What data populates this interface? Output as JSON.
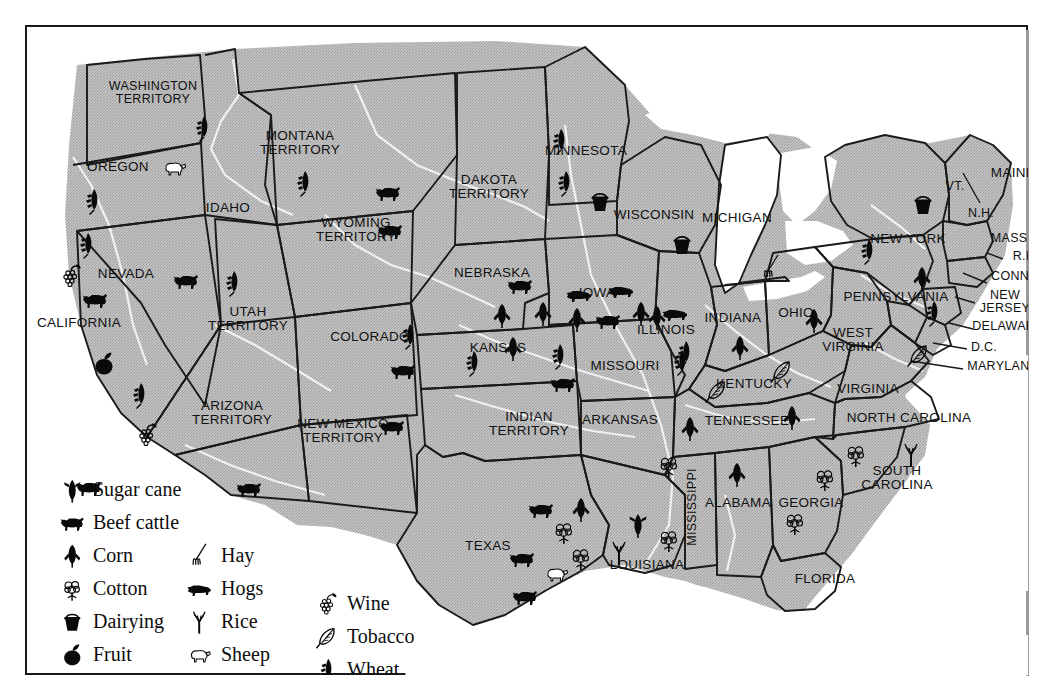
{
  "map": {
    "background_color": "#b9b9b9",
    "water_color": "#ffffff",
    "border_color": "#1a1a1a",
    "river_color": "#f2f2f2"
  },
  "legend": {
    "columns": [
      {
        "items": [
          {
            "label": "Sugar cane",
            "icon": "sugar-cane-icon"
          },
          {
            "label": "Beef cattle",
            "icon": "beef-cattle-icon"
          },
          {
            "label": "Corn",
            "icon": "corn-icon"
          },
          {
            "label": "Cotton",
            "icon": "cotton-icon"
          },
          {
            "label": "Dairying",
            "icon": "dairying-icon"
          },
          {
            "label": "Fruit",
            "icon": "fruit-icon"
          }
        ]
      },
      {
        "items": [
          {
            "label": "Hay",
            "icon": "hay-icon"
          },
          {
            "label": "Hogs",
            "icon": "hogs-icon"
          },
          {
            "label": "Rice",
            "icon": "rice-icon"
          },
          {
            "label": "Sheep",
            "icon": "sheep-icon"
          }
        ]
      },
      {
        "items": [
          {
            "label": "Wine",
            "icon": "wine-icon"
          },
          {
            "label": "Tobacco",
            "icon": "tobacco-icon"
          },
          {
            "label": "Wheat",
            "icon": "wheat-icon"
          }
        ]
      }
    ]
  },
  "states": [
    {
      "name": "WASHINGTON\nTERRITORY",
      "x": 128,
      "y": 68,
      "size": "s12"
    },
    {
      "name": "OREGON",
      "x": 93,
      "y": 142,
      "size": "s13"
    },
    {
      "name": "IDAHO",
      "x": 203,
      "y": 183,
      "size": "s13"
    },
    {
      "name": "MONTANA\nTERRITORY",
      "x": 275,
      "y": 118,
      "size": "s13"
    },
    {
      "name": "WYOMING\nTERRITORY",
      "x": 331,
      "y": 205,
      "size": "s13"
    },
    {
      "name": "NEVADA",
      "x": 101,
      "y": 249,
      "size": "s13"
    },
    {
      "name": "CALIFORNIA",
      "x": 54,
      "y": 298,
      "size": "s13"
    },
    {
      "name": "UTAH\nTERRITORY",
      "x": 223,
      "y": 294,
      "size": "s13"
    },
    {
      "name": "ARIZONA\nTERRITORY",
      "x": 207,
      "y": 388,
      "size": "s13"
    },
    {
      "name": "NEW MEXICO\nTERRITORY",
      "x": 318,
      "y": 406,
      "size": "s13"
    },
    {
      "name": "COLORADO",
      "x": 345,
      "y": 312,
      "size": "s13"
    },
    {
      "name": "DAKOTA\nTERRITORY",
      "x": 464,
      "y": 162,
      "size": "s13"
    },
    {
      "name": "NEBRASKA",
      "x": 467,
      "y": 248,
      "size": "s13"
    },
    {
      "name": "KANSAS",
      "x": 473,
      "y": 323,
      "size": "s13"
    },
    {
      "name": "INDIAN\nTERRITORY",
      "x": 504,
      "y": 399,
      "size": "s13"
    },
    {
      "name": "TEXAS",
      "x": 463,
      "y": 521,
      "size": "s13"
    },
    {
      "name": "MINNESOTA",
      "x": 561,
      "y": 126,
      "size": "s13"
    },
    {
      "name": "IOWA",
      "x": 572,
      "y": 268,
      "size": "s13"
    },
    {
      "name": "MISSOURI",
      "x": 600,
      "y": 341,
      "size": "s13"
    },
    {
      "name": "ARKANSAS",
      "x": 595,
      "y": 395,
      "size": "s13"
    },
    {
      "name": "LOUISIANA",
      "x": 622,
      "y": 540,
      "size": "s13"
    },
    {
      "name": "WISCONSIN",
      "x": 629,
      "y": 190,
      "size": "s13"
    },
    {
      "name": "ILLINOIS",
      "x": 641,
      "y": 305,
      "size": "s13"
    },
    {
      "name": "MICHIGAN",
      "x": 712,
      "y": 193,
      "size": "s13"
    },
    {
      "name": "INDIANA",
      "x": 708,
      "y": 293,
      "size": "s13"
    },
    {
      "name": "KENTUCKY",
      "x": 729,
      "y": 359,
      "size": "s13"
    },
    {
      "name": "TENNESSEE",
      "x": 722,
      "y": 396,
      "size": "s13"
    },
    {
      "name": "MISSISSIPPI",
      "x": 668,
      "y": 482,
      "size": "s12",
      "vertical": true
    },
    {
      "name": "ALABAMA",
      "x": 713,
      "y": 478,
      "size": "s13"
    },
    {
      "name": "GEORGIA",
      "x": 786,
      "y": 478,
      "size": "s13"
    },
    {
      "name": "FLORIDA",
      "x": 800,
      "y": 554,
      "size": "s13"
    },
    {
      "name": "OHIO",
      "x": 771,
      "y": 288,
      "size": "s13"
    },
    {
      "name": "WEST\nVIRGINIA",
      "x": 828,
      "y": 315,
      "size": "s13"
    },
    {
      "name": "VIRGINIA",
      "x": 843,
      "y": 364,
      "size": "s13"
    },
    {
      "name": "NORTH CAROLINA",
      "x": 884,
      "y": 393,
      "size": "s13"
    },
    {
      "name": "SOUTH\nCAROLINA",
      "x": 872,
      "y": 453,
      "size": "s13"
    },
    {
      "name": "PENNSYLVANIA",
      "x": 871,
      "y": 272,
      "size": "s13"
    },
    {
      "name": "NEW YORK",
      "x": 883,
      "y": 214,
      "size": "s13"
    },
    {
      "name": "MAINE",
      "x": 988,
      "y": 148,
      "size": "s13"
    },
    {
      "name": "VT.",
      "x": 930,
      "y": 162,
      "size": "s12"
    },
    {
      "name": "N.H.",
      "x": 956,
      "y": 189,
      "size": "s12"
    },
    {
      "name": "MASS.",
      "x": 986,
      "y": 214,
      "size": "s12"
    },
    {
      "name": "R.I.",
      "x": 998,
      "y": 232,
      "size": "s12"
    },
    {
      "name": "CONN.",
      "x": 987,
      "y": 252,
      "size": "s12"
    },
    {
      "name": "NEW\nJERSEY",
      "x": 980,
      "y": 277,
      "size": "s12"
    },
    {
      "name": "DELAWARE",
      "x": 983,
      "y": 302,
      "size": "s12"
    },
    {
      "name": "D.C.",
      "x": 959,
      "y": 323,
      "size": "s12"
    },
    {
      "name": "MARYLAND",
      "x": 978,
      "y": 342,
      "size": "s12"
    }
  ],
  "commodity_icons": [
    {
      "type": "wheat-icon",
      "state": "WASHINGTON TERRITORY",
      "x": 178,
      "y": 105
    },
    {
      "type": "sheep-icon",
      "state": "OREGON",
      "x": 149,
      "y": 145
    },
    {
      "type": "wheat-icon",
      "state": "OREGON",
      "x": 68,
      "y": 178
    },
    {
      "type": "wheat-icon",
      "state": "CALIFORNIA",
      "x": 62,
      "y": 222
    },
    {
      "type": "wine-icon",
      "state": "CALIFORNIA",
      "x": 46,
      "y": 253
    },
    {
      "type": "beef-cattle-icon",
      "state": "CALIFORNIA",
      "x": 70,
      "y": 277
    },
    {
      "type": "fruit-icon",
      "state": "CALIFORNIA",
      "x": 79,
      "y": 341
    },
    {
      "type": "wheat-icon",
      "state": "CALIFORNIA",
      "x": 115,
      "y": 372
    },
    {
      "type": "wine-icon",
      "state": "CALIFORNIA",
      "x": 122,
      "y": 412
    },
    {
      "type": "wheat-icon",
      "state": "MONTANA TERRITORY",
      "x": 279,
      "y": 160
    },
    {
      "type": "beef-cattle-icon",
      "state": "MONTANA TERRITORY",
      "x": 363,
      "y": 170
    },
    {
      "type": "beef-cattle-icon",
      "state": "WYOMING TERRITORY",
      "x": 365,
      "y": 208
    },
    {
      "type": "beef-cattle-icon",
      "state": "UTAH TERRITORY",
      "x": 64,
      "y": 465
    },
    {
      "type": "beef-cattle-icon",
      "state": "UTAH TERRITORY",
      "x": 161,
      "y": 258
    },
    {
      "type": "wheat-icon",
      "state": "UTAH TERRITORY",
      "x": 208,
      "y": 260
    },
    {
      "type": "wheat-icon",
      "state": "COLORADO",
      "x": 384,
      "y": 313
    },
    {
      "type": "beef-cattle-icon",
      "state": "COLORADO",
      "x": 378,
      "y": 348
    },
    {
      "type": "beef-cattle-icon",
      "state": "NEW MEXICO TERRITORY",
      "x": 367,
      "y": 404
    },
    {
      "type": "beef-cattle-icon",
      "state": "ARIZONA TERRITORY",
      "x": 224,
      "y": 466
    },
    {
      "type": "beef-cattle-icon",
      "state": "NEBRASKA",
      "x": 495,
      "y": 263
    },
    {
      "type": "corn-icon",
      "state": "NEBRASKA",
      "x": 477,
      "y": 293
    },
    {
      "type": "corn-icon",
      "state": "NEBRASKA",
      "x": 518,
      "y": 291
    },
    {
      "type": "corn-icon",
      "state": "KANSAS",
      "x": 488,
      "y": 326
    },
    {
      "type": "wheat-icon",
      "state": "KANSAS",
      "x": 448,
      "y": 340
    },
    {
      "type": "wheat-icon",
      "state": "KANSAS",
      "x": 534,
      "y": 333
    },
    {
      "type": "beef-cattle-icon",
      "state": "KANSAS",
      "x": 538,
      "y": 361
    },
    {
      "type": "wheat-icon",
      "state": "MINNESOTA",
      "x": 535,
      "y": 118
    },
    {
      "type": "wheat-icon",
      "state": "MINNESOTA",
      "x": 540,
      "y": 160
    },
    {
      "type": "dairying-icon",
      "state": "MINNESOTA",
      "x": 575,
      "y": 179
    },
    {
      "type": "dairying-icon",
      "state": "WISCONSIN",
      "x": 657,
      "y": 222
    },
    {
      "type": "hogs-icon",
      "state": "IOWA",
      "x": 554,
      "y": 272
    },
    {
      "type": "hogs-icon",
      "state": "IOWA",
      "x": 596,
      "y": 268
    },
    {
      "type": "corn-icon",
      "state": "IOWA",
      "x": 552,
      "y": 297
    },
    {
      "type": "corn-icon",
      "state": "IOWA",
      "x": 616,
      "y": 291
    },
    {
      "type": "beef-cattle-icon",
      "state": "IOWA",
      "x": 583,
      "y": 298
    },
    {
      "type": "corn-icon",
      "state": "ILLINOIS",
      "x": 632,
      "y": 295
    },
    {
      "type": "wheat-icon",
      "state": "ILLINOIS",
      "x": 656,
      "y": 339
    },
    {
      "type": "hogs-icon",
      "state": "INDIANA",
      "x": 650,
      "y": 291
    },
    {
      "type": "corn-icon",
      "state": "INDIANA",
      "x": 715,
      "y": 325
    },
    {
      "type": "hay-icon",
      "state": "MICHIGAN",
      "x": 746,
      "y": 245
    },
    {
      "type": "wheat-icon",
      "state": "MISSOURI",
      "x": 660,
      "y": 330
    },
    {
      "type": "tobacco-icon",
      "state": "KENTUCKY",
      "x": 692,
      "y": 368
    },
    {
      "type": "tobacco-icon",
      "state": "KENTUCKY",
      "x": 757,
      "y": 348
    },
    {
      "type": "corn-icon",
      "state": "OHIO",
      "x": 789,
      "y": 298
    },
    {
      "type": "corn-icon",
      "state": "TENNESSEE",
      "x": 665,
      "y": 406
    },
    {
      "type": "corn-icon",
      "state": "TENNESSEE",
      "x": 767,
      "y": 395
    },
    {
      "type": "wheat-icon",
      "state": "NEW YORK",
      "x": 843,
      "y": 228
    },
    {
      "type": "dairying-icon",
      "state": "NEW YORK",
      "x": 898,
      "y": 182
    },
    {
      "type": "corn-icon",
      "state": "PENNSYLVANIA",
      "x": 897,
      "y": 256
    },
    {
      "type": "wheat-icon",
      "state": "PENNSYLVANIA",
      "x": 908,
      "y": 290
    },
    {
      "type": "tobacco-icon",
      "state": "VIRGINIA",
      "x": 894,
      "y": 332
    },
    {
      "type": "rice-icon",
      "state": "NORTH CAROLINA",
      "x": 886,
      "y": 432
    },
    {
      "type": "cotton-icon",
      "state": "SOUTH CAROLINA",
      "x": 831,
      "y": 432
    },
    {
      "type": "cotton-icon",
      "state": "SOUTH CAROLINA",
      "x": 800,
      "y": 456
    },
    {
      "type": "cotton-icon",
      "state": "GEORGIA",
      "x": 770,
      "y": 500
    },
    {
      "type": "corn-icon",
      "state": "ALABAMA",
      "x": 712,
      "y": 452
    },
    {
      "type": "cotton-icon",
      "state": "MISSISSIPPI",
      "x": 644,
      "y": 443
    },
    {
      "type": "cotton-icon",
      "state": "MISSISSIPPI",
      "x": 644,
      "y": 517
    },
    {
      "type": "sugar-cane-icon",
      "state": "LOUISIANA",
      "x": 613,
      "y": 502
    },
    {
      "type": "rice-icon",
      "state": "LOUISIANA",
      "x": 594,
      "y": 530
    },
    {
      "type": "beef-cattle-icon",
      "state": "TEXAS",
      "x": 516,
      "y": 487
    },
    {
      "type": "beef-cattle-icon",
      "state": "TEXAS",
      "x": 497,
      "y": 536
    },
    {
      "type": "beef-cattle-icon",
      "state": "TEXAS",
      "x": 500,
      "y": 574
    },
    {
      "type": "corn-icon",
      "state": "TEXAS",
      "x": 556,
      "y": 487
    },
    {
      "type": "cotton-icon",
      "state": "TEXAS",
      "x": 539,
      "y": 509
    },
    {
      "type": "cotton-icon",
      "state": "TEXAS",
      "x": 556,
      "y": 535
    },
    {
      "type": "sheep-icon",
      "state": "TEXAS",
      "x": 531,
      "y": 551
    }
  ]
}
